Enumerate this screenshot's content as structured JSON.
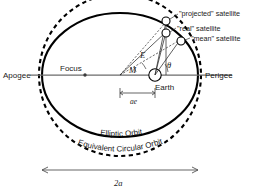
{
  "figure": {
    "labels": {
      "apogee": "Apogee",
      "perigee": "Perigee",
      "focus": "Focus",
      "earth": "Earth",
      "projected_satellite": "\"projected\" satellite",
      "real_satellite": "\"real\" satellite",
      "mean_satellite": "\"mean\" satellite",
      "elliptic_orbit": "Elliptic Orbit",
      "equivalent_circular_orbit": "Equivalent Circular Orbit",
      "semi_major_dimension": "2a",
      "focal_offset": "ae",
      "angle_eccentric": "E",
      "angle_mean": "M",
      "angle_true": "θ"
    },
    "colors": {
      "orbit_stroke": "#000000",
      "axis_stroke": "#6b6b6b",
      "text": "#1a1a1a",
      "background": "#ffffff"
    },
    "geometry": {
      "center_x": 120,
      "center_y": 75,
      "semi_major_a": 78,
      "semi_minor_b": 62,
      "circle_radius": 81,
      "focus_earth_x": 155,
      "focus_left_x": 85,
      "apogee_x": 42,
      "perigee_x": 198
    }
  }
}
